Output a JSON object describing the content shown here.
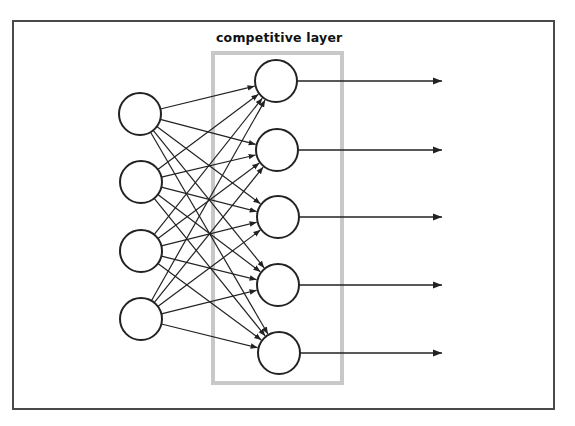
{
  "diagram": {
    "title": "",
    "layer_label": "competitive layer",
    "colors": {
      "frame": "#4a4a4a",
      "layer_box": "#c8c8c8",
      "node_stroke": "#222222",
      "edge": "#222222",
      "background": "#ffffff"
    },
    "frame": {
      "x": 12,
      "y": 20,
      "width": 543,
      "height": 390
    },
    "layer_box": {
      "x": 213,
      "y": 53,
      "width": 129,
      "height": 330
    },
    "node_radius": 21,
    "input_nodes": [
      {
        "id": "in1",
        "cx": 140,
        "cy": 114
      },
      {
        "id": "in2",
        "cx": 141,
        "cy": 182
      },
      {
        "id": "in3",
        "cx": 141,
        "cy": 251
      },
      {
        "id": "in4",
        "cx": 141,
        "cy": 319
      }
    ],
    "competitive_nodes": [
      {
        "id": "c1",
        "cx": 276,
        "cy": 81
      },
      {
        "id": "c2",
        "cx": 277,
        "cy": 150
      },
      {
        "id": "c3",
        "cx": 278,
        "cy": 217
      },
      {
        "id": "c4",
        "cx": 278,
        "cy": 285
      },
      {
        "id": "c5",
        "cx": 279,
        "cy": 353
      }
    ],
    "connections": "fully-connected: every input node to every competitive node (4 x 5 = 20 directed edges)",
    "outputs": [
      {
        "from": "c1",
        "y": 81,
        "x_end": 442
      },
      {
        "from": "c2",
        "y": 150,
        "x_end": 442
      },
      {
        "from": "c3",
        "y": 217,
        "x_end": 442
      },
      {
        "from": "c4",
        "y": 285,
        "x_end": 442
      },
      {
        "from": "c5",
        "y": 353,
        "x_end": 442
      }
    ]
  }
}
